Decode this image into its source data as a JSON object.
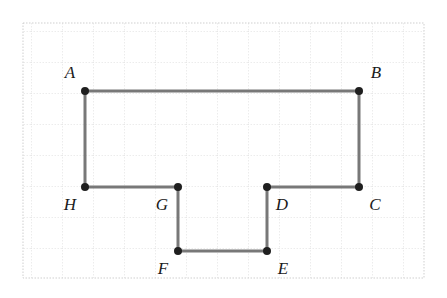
{
  "figure": {
    "kind": "geometry-diagram",
    "canvas": {
      "width": 447,
      "height": 298
    },
    "background_color": "#ffffff"
  },
  "grid": {
    "visible": true,
    "style": "dotted",
    "line_color": "#d9d9d9",
    "major_line_color": "#cfcfcf",
    "cell_size": 31,
    "origin_x": 23,
    "origin_y": 23,
    "width": 401,
    "height": 255,
    "columns": 13,
    "rows": 8
  },
  "polygon": {
    "name": "ABCDEFGH",
    "stroke_color": "#787878",
    "stroke_width": 3,
    "fill": "none",
    "closed": true,
    "vertex_order": [
      "A",
      "B",
      "C",
      "D",
      "E",
      "F",
      "G",
      "H"
    ],
    "path_points": "85,91 359,91 359,187 267,187 267,251 178,251 178,187 85,187"
  },
  "vertices": [
    {
      "id": "A",
      "label": "A",
      "x": 85,
      "y": 91,
      "label_x": 70,
      "label_y": 74,
      "label_position": "above-left"
    },
    {
      "id": "B",
      "label": "B",
      "x": 359,
      "y": 91,
      "label_x": 376,
      "label_y": 74,
      "label_position": "above-right"
    },
    {
      "id": "C",
      "label": "C",
      "x": 359,
      "y": 187,
      "label_x": 375,
      "label_y": 206,
      "label_position": "below-right"
    },
    {
      "id": "D",
      "label": "D",
      "x": 267,
      "y": 187,
      "label_x": 282,
      "label_y": 206,
      "label_position": "below-right"
    },
    {
      "id": "E",
      "label": "E",
      "x": 267,
      "y": 251,
      "label_x": 283,
      "label_y": 270,
      "label_position": "below-right"
    },
    {
      "id": "F",
      "label": "F",
      "x": 178,
      "y": 251,
      "label_x": 163,
      "label_y": 270,
      "label_position": "below-left"
    },
    {
      "id": "G",
      "label": "G",
      "x": 178,
      "y": 187,
      "label_x": 162,
      "label_y": 206,
      "label_position": "below-left"
    },
    {
      "id": "H",
      "label": "H",
      "x": 85,
      "y": 187,
      "label_x": 70,
      "label_y": 206,
      "label_position": "below-left"
    }
  ],
  "vertex_marker": {
    "radius": 4,
    "fill_color": "#1f1f1f",
    "stroke": "none"
  }
}
